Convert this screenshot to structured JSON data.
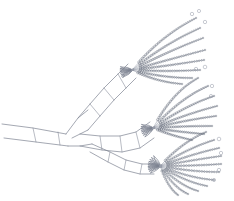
{
  "figure": {
    "kind": "scientific-line-drawing",
    "caption": "",
    "background_color": "#ffffff",
    "outline_color": "#7d8290",
    "seta_shaft_color": "#9aa0ac",
    "bead_color": "#5f6673",
    "free_bead_color": "#9298a6",
    "canvas": {
      "width": 234,
      "height": 201
    }
  },
  "structure": {
    "basal_stalk": {
      "name": "basal-stalk",
      "upper_edge": "M 2 124 L 33 128 L 66 134",
      "lower_edge": "M 4 138 L 36 142 L 68 146",
      "joints": [
        "M 33 128 L 36 142",
        "M 58 132 L 60 145"
      ]
    },
    "fork": {
      "name": "limb-fork",
      "path": "M 66 134 L 78 118 L 88 110",
      "lower_path": "M 68 146 L 80 146 L 92 144",
      "inner_notch": "M 72 138 L 80 134 L 88 130"
    },
    "upper_ramus": {
      "name": "upper-ramus",
      "dorsal_edge": "M 78 118 L 90 104 L 104 88 L 118 74 L 128 64",
      "ventral_edge": "M 88 130 L 100 116 L 114 100 L 126 88 L 136 78",
      "joints": [
        "M 90 104 L 100 116",
        "M 104 88 L 114 100",
        "M 118 74 L 126 88"
      ]
    },
    "mid_ramus": {
      "name": "middle-ramus",
      "dorsal_edge": "M 80 134 L 100 136 L 120 136 L 136 132 L 150 122",
      "ventral_edge": "M 80 146 L 102 150 L 122 152 L 140 148 L 154 138",
      "joints": [
        "M 100 136 L 102 150",
        "M 120 136 L 122 152",
        "M 136 132 L 140 148"
      ]
    },
    "lower_ramus": {
      "name": "lower-ramus",
      "dorsal_edge": "M 92 144 L 110 152 L 126 160 L 142 164 L 156 164",
      "ventral_edge": "M 90 152 L 108 162 L 124 170 L 140 174 L 154 174",
      "joints": [
        "M 110 152 L 108 162",
        "M 126 160 L 124 170",
        "M 142 164 L 140 174"
      ]
    },
    "palms": [
      {
        "name": "upper-palm",
        "cx": 133,
        "cy": 70,
        "rays": 8
      },
      {
        "name": "middle-palm",
        "cx": 154,
        "cy": 128,
        "rays": 8
      },
      {
        "name": "lower-palm",
        "cx": 160,
        "cy": 168,
        "rays": 11
      }
    ]
  },
  "seta_fans": [
    {
      "name": "upper-seta-fan",
      "origin": {
        "x": 132,
        "y": 70
      },
      "setae": [
        {
          "end_x": 196,
          "end_y": 18,
          "curve_x": 160,
          "curve_y": 36,
          "beads": 30
        },
        {
          "end_x": 200,
          "end_y": 28,
          "curve_x": 164,
          "curve_y": 44,
          "beads": 30
        },
        {
          "end_x": 203,
          "end_y": 38,
          "curve_x": 166,
          "curve_y": 52,
          "beads": 29
        },
        {
          "end_x": 205,
          "end_y": 50,
          "curve_x": 167,
          "curve_y": 60,
          "beads": 28
        },
        {
          "end_x": 204,
          "end_y": 60,
          "curve_x": 167,
          "curve_y": 66,
          "beads": 27
        },
        {
          "end_x": 200,
          "end_y": 70,
          "curve_x": 166,
          "curve_y": 72,
          "beads": 26
        },
        {
          "end_x": 192,
          "end_y": 78,
          "curve_x": 162,
          "curve_y": 78,
          "beads": 24
        },
        {
          "end_x": 182,
          "end_y": 84,
          "curve_x": 156,
          "curve_y": 82,
          "beads": 21
        }
      ]
    },
    {
      "name": "middle-seta-fan",
      "origin": {
        "x": 153,
        "y": 128
      },
      "setae": [
        {
          "end_x": 198,
          "end_y": 78,
          "curve_x": 172,
          "curve_y": 92,
          "beads": 26
        },
        {
          "end_x": 208,
          "end_y": 86,
          "curve_x": 180,
          "curve_y": 98,
          "beads": 27
        },
        {
          "end_x": 214,
          "end_y": 96,
          "curve_x": 184,
          "curve_y": 106,
          "beads": 27
        },
        {
          "end_x": 217,
          "end_y": 106,
          "curve_x": 186,
          "curve_y": 114,
          "beads": 26
        },
        {
          "end_x": 216,
          "end_y": 116,
          "curve_x": 186,
          "curve_y": 120,
          "beads": 25
        },
        {
          "end_x": 212,
          "end_y": 126,
          "curve_x": 184,
          "curve_y": 126,
          "beads": 24
        },
        {
          "end_x": 204,
          "end_y": 134,
          "curve_x": 180,
          "curve_y": 132,
          "beads": 22
        },
        {
          "end_x": 192,
          "end_y": 140,
          "curve_x": 172,
          "curve_y": 136,
          "beads": 19
        }
      ]
    },
    {
      "name": "lower-seta-fan",
      "origin": {
        "x": 160,
        "y": 166
      },
      "setae": [
        {
          "end_x": 206,
          "end_y": 132,
          "curve_x": 182,
          "curve_y": 142,
          "beads": 22
        },
        {
          "end_x": 214,
          "end_y": 140,
          "curve_x": 188,
          "curve_y": 148,
          "beads": 22
        },
        {
          "end_x": 219,
          "end_y": 148,
          "curve_x": 192,
          "curve_y": 154,
          "beads": 22
        },
        {
          "end_x": 221,
          "end_y": 156,
          "curve_x": 193,
          "curve_y": 160,
          "beads": 21
        },
        {
          "end_x": 221,
          "end_y": 164,
          "curve_x": 193,
          "curve_y": 166,
          "beads": 21
        },
        {
          "end_x": 219,
          "end_y": 172,
          "curve_x": 192,
          "curve_y": 172,
          "beads": 20
        },
        {
          "end_x": 214,
          "end_y": 180,
          "curve_x": 189,
          "curve_y": 178,
          "beads": 19
        },
        {
          "end_x": 207,
          "end_y": 186,
          "curve_x": 185,
          "curve_y": 182,
          "beads": 18
        },
        {
          "end_x": 198,
          "end_y": 191,
          "curve_x": 180,
          "curve_y": 186,
          "beads": 16
        },
        {
          "end_x": 188,
          "end_y": 194,
          "curve_x": 174,
          "curve_y": 188,
          "beads": 14
        },
        {
          "end_x": 178,
          "end_y": 195,
          "curve_x": 168,
          "curve_y": 188,
          "beads": 12
        }
      ]
    }
  ],
  "free_beads": [
    {
      "cx": 192,
      "cy": 14,
      "r": 1.7
    },
    {
      "cx": 199,
      "cy": 11,
      "r": 1.6
    },
    {
      "cx": 205,
      "cy": 22,
      "r": 1.7
    },
    {
      "cx": 196,
      "cy": 69,
      "r": 1.7
    },
    {
      "cx": 205,
      "cy": 67,
      "r": 1.8
    },
    {
      "cx": 212,
      "cy": 86,
      "r": 1.7
    },
    {
      "cx": 211,
      "cy": 96,
      "r": 1.6
    },
    {
      "cx": 219,
      "cy": 139,
      "r": 1.8
    },
    {
      "cx": 221,
      "cy": 153,
      "r": 1.7
    },
    {
      "cx": 219,
      "cy": 170,
      "r": 1.7
    },
    {
      "cx": 214,
      "cy": 180,
      "r": 1.6
    }
  ]
}
